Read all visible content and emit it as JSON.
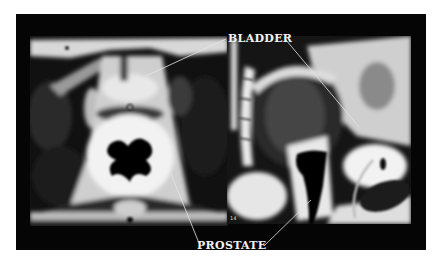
{
  "figure": {
    "background": "#ffffff",
    "frame_color": "#050505",
    "label_color": "#f2f2f2",
    "panels": [
      {
        "id": "left",
        "view": "axial MRI of pelvis"
      },
      {
        "id": "right",
        "view": "sagittal MRI of pelvis",
        "slice_number": "14"
      }
    ],
    "labels": {
      "bladder": "BLADDER",
      "prostate": "PROSTATE"
    }
  }
}
